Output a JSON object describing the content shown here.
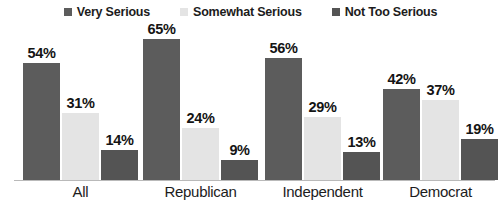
{
  "chart_data": {
    "type": "bar",
    "title": "",
    "subtitle": "",
    "xlabel": "",
    "ylabel": "",
    "ylim": [
      0,
      70
    ],
    "grid": false,
    "legend_position": "top-center",
    "value_suffix": "%",
    "categories": [
      "All",
      "Republican",
      "Independent",
      "Democrat"
    ],
    "series": [
      {
        "name": "Very Serious",
        "color": "#5c5c5c",
        "values": [
          54,
          65,
          56,
          42
        ],
        "labels": [
          "54%",
          "65%",
          "56%",
          "42%"
        ]
      },
      {
        "name": "Somewhat Serious",
        "color": "#e4e4e4",
        "values": [
          31,
          24,
          29,
          37
        ],
        "labels": [
          "31%",
          "24%",
          "29%",
          "37%"
        ]
      },
      {
        "name": "Not Too Serious",
        "color": "#545454",
        "values": [
          14,
          9,
          13,
          19
        ],
        "labels": [
          "14%",
          "9%",
          "13%",
          "19%"
        ]
      }
    ]
  },
  "legend": {
    "items": [
      {
        "label": "Very Serious",
        "color": "#5c5c5c",
        "swatch_name": "legend-swatch-very-serious"
      },
      {
        "label": "Somewhat Serious",
        "color": "#e4e4e4",
        "swatch_name": "legend-swatch-somewhat-serious"
      },
      {
        "label": "Not Too Serious",
        "color": "#545454",
        "swatch_name": "legend-swatch-not-too-serious"
      }
    ]
  },
  "axis": {
    "categories": [
      "All",
      "Republican",
      "Independent",
      "Democrat"
    ]
  },
  "colors": {
    "background": "#ffffff",
    "text": "#1c1c1c",
    "baseline": "#b9b9b9",
    "series_very_serious": "#5c5c5c",
    "series_somewhat_serious": "#e4e4e4",
    "series_not_too_serious": "#545454"
  }
}
